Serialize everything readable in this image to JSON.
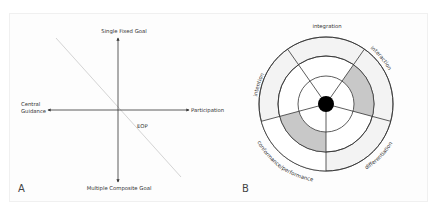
{
  "panel_a": {
    "panel_label": "A",
    "axes": {
      "top": "Single Fixed Goal",
      "bottom": "Multiple Composite Goal",
      "left_line1": "Central",
      "left_line2": "Guidance",
      "right": "Participation"
    },
    "diagonal_label": "EOP"
  },
  "panel_b": {
    "panel_label": "B",
    "segments": {
      "top": "integration",
      "left": "intention",
      "right": "interaction",
      "bottom_right": "differentiation",
      "bottom_left": "conformance/performance"
    },
    "colors": {
      "outer_fill": "#f3f3f3",
      "shaded_fill": "#c8c8c8",
      "line": "#333333",
      "center_dot": "#000000"
    }
  }
}
